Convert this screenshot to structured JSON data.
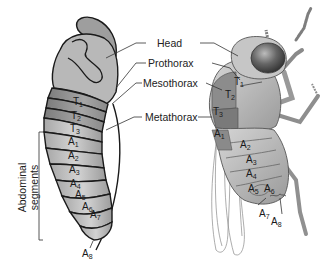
{
  "diagram": {
    "type": "labeled anatomical illustration",
    "center_labels": [
      {
        "id": "head",
        "text": "Head"
      },
      {
        "id": "prothorax",
        "text": "Prothorax"
      },
      {
        "id": "mesothorax",
        "text": "Mesothorax"
      },
      {
        "id": "metathorax",
        "text": "Metathorax"
      }
    ],
    "bracket_label": {
      "line1": "Abdominal",
      "line2": "segments"
    },
    "left_segments": {
      "thoracic": [
        {
          "letter": "T",
          "num": "1"
        },
        {
          "letter": "T",
          "num": "2"
        },
        {
          "letter": "T",
          "num": "3"
        }
      ],
      "abdominal": [
        {
          "letter": "A",
          "num": "1"
        },
        {
          "letter": "A",
          "num": "2"
        },
        {
          "letter": "A",
          "num": "3"
        },
        {
          "letter": "A",
          "num": "4"
        },
        {
          "letter": "A",
          "num": "5"
        },
        {
          "letter": "A",
          "num": "6"
        },
        {
          "letter": "A",
          "num": "7"
        },
        {
          "letter": "A",
          "num": "8"
        }
      ]
    },
    "right_segments": {
      "thoracic": [
        {
          "letter": "T",
          "num": "1"
        },
        {
          "letter": "T",
          "num": "2"
        },
        {
          "letter": "T",
          "num": "3"
        }
      ],
      "abdominal": [
        {
          "letter": "A",
          "num": "1"
        },
        {
          "letter": "A",
          "num": "2"
        },
        {
          "letter": "A",
          "num": "3"
        },
        {
          "letter": "A",
          "num": "4"
        },
        {
          "letter": "A",
          "num": "5"
        },
        {
          "letter": "A",
          "num": "6"
        },
        {
          "letter": "A",
          "num": "7"
        },
        {
          "letter": "A",
          "num": "8"
        }
      ]
    },
    "colors": {
      "background": "#ffffff",
      "outline": "#1a1a1a",
      "light_fill": "#bdbdbd",
      "mid_fill": "#9a9a9a",
      "dark_fill": "#7a7a7a",
      "eye": "#4a4a4a",
      "leader_line": "#333333"
    }
  }
}
